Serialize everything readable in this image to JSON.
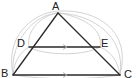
{
  "diagram": {
    "type": "geometry-triangle",
    "colors": {
      "edge": "#2a2a2a",
      "construction_arc": "#c8c8c8",
      "parallel_arrow": "#b0b0b0",
      "background": "#ffffff"
    },
    "points": [
      {
        "id": "A",
        "label": "A",
        "x": 58,
        "y": 13
      },
      {
        "id": "B",
        "label": "B",
        "x": 13,
        "y": 75
      },
      {
        "id": "C",
        "label": "C",
        "x": 120,
        "y": 75
      },
      {
        "id": "D",
        "label": "D",
        "x": 29,
        "y": 47
      },
      {
        "id": "E",
        "label": "E",
        "x": 100,
        "y": 47
      }
    ],
    "segments": [
      {
        "from": "A",
        "to": "B"
      },
      {
        "from": "A",
        "to": "C"
      },
      {
        "from": "B",
        "to": "C",
        "parallel_mark": true
      },
      {
        "from": "D",
        "to": "E",
        "parallel_mark": true
      }
    ],
    "relations": [
      "DE ∥ BC"
    ]
  },
  "labels": {
    "A": "A",
    "B": "B",
    "C": "C",
    "D": "D",
    "E": "E"
  }
}
